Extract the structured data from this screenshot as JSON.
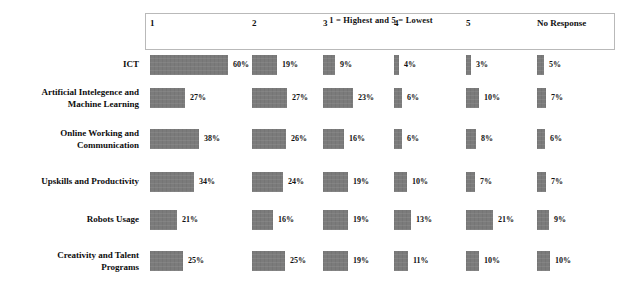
{
  "chart_data": {
    "type": "bar",
    "orientation": "horizontal-grouped",
    "title": "1 = Highest and 5 = Lowest",
    "xlabel": "",
    "ylabel": "",
    "grid": false,
    "legend": "none",
    "value_suffix": "%",
    "xlim": [
      0,
      60
    ],
    "categories": [
      "ICT",
      "Artificial Intelegence and Machine Learning",
      "Online Working and Communication",
      "Upskills and Productivity",
      "Robots Usage",
      "Creativity and Talent Programs"
    ],
    "column_headers": [
      "1",
      "2",
      "3",
      "4",
      "5",
      "No Response"
    ],
    "series": [
      {
        "name": "1",
        "values": [
          60,
          27,
          38,
          34,
          21,
          25
        ]
      },
      {
        "name": "2",
        "values": [
          19,
          27,
          26,
          24,
          16,
          25
        ]
      },
      {
        "name": "3",
        "values": [
          9,
          23,
          16,
          19,
          19,
          19
        ]
      },
      {
        "name": "4",
        "values": [
          4,
          6,
          6,
          10,
          13,
          11
        ]
      },
      {
        "name": "5",
        "values": [
          3,
          10,
          8,
          7,
          21,
          10
        ]
      },
      {
        "name": "No Response",
        "values": [
          5,
          7,
          6,
          7,
          9,
          10
        ]
      }
    ],
    "rows": [
      {
        "label": "ICT",
        "label_lines": [
          "ICT"
        ],
        "cells": [
          {
            "value": "60%",
            "pct": 60
          },
          {
            "value": "19%",
            "pct": 19
          },
          {
            "value": "9%",
            "pct": 9
          },
          {
            "value": "4%",
            "pct": 4
          },
          {
            "value": "3%",
            "pct": 3
          },
          {
            "value": "5%",
            "pct": 5
          }
        ]
      },
      {
        "label": "Artificial Intelegence and Machine Learning",
        "label_lines": [
          "Artificial Intelegence and",
          "Machine Learning"
        ],
        "cells": [
          {
            "value": "27%",
            "pct": 27
          },
          {
            "value": "27%",
            "pct": 27
          },
          {
            "value": "23%",
            "pct": 23
          },
          {
            "value": "6%",
            "pct": 6
          },
          {
            "value": "10%",
            "pct": 10
          },
          {
            "value": "7%",
            "pct": 7
          }
        ]
      },
      {
        "label": "Online Working and Communication",
        "label_lines": [
          "Online Working and",
          "Communication"
        ],
        "cells": [
          {
            "value": "38%",
            "pct": 38
          },
          {
            "value": "26%",
            "pct": 26
          },
          {
            "value": "16%",
            "pct": 16
          },
          {
            "value": "6%",
            "pct": 6
          },
          {
            "value": "8%",
            "pct": 8
          },
          {
            "value": "6%",
            "pct": 6
          }
        ]
      },
      {
        "label": "Upskills and Productivity",
        "label_lines": [
          "Upskills and Productivity"
        ],
        "cells": [
          {
            "value": "34%",
            "pct": 34
          },
          {
            "value": "24%",
            "pct": 24
          },
          {
            "value": "19%",
            "pct": 19
          },
          {
            "value": "10%",
            "pct": 10
          },
          {
            "value": "7%",
            "pct": 7
          },
          {
            "value": "7%",
            "pct": 7
          }
        ]
      },
      {
        "label": "Robots Usage",
        "label_lines": [
          "Robots Usage"
        ],
        "cells": [
          {
            "value": "21%",
            "pct": 21
          },
          {
            "value": "16%",
            "pct": 16
          },
          {
            "value": "19%",
            "pct": 19
          },
          {
            "value": "13%",
            "pct": 13
          },
          {
            "value": "21%",
            "pct": 21
          },
          {
            "value": "9%",
            "pct": 9
          }
        ]
      },
      {
        "label": "Creativity and Talent Programs",
        "label_lines": [
          "Creativity and Talent",
          "Programs"
        ],
        "cells": [
          {
            "value": "25%",
            "pct": 25
          },
          {
            "value": "25%",
            "pct": 25
          },
          {
            "value": "19%",
            "pct": 19
          },
          {
            "value": "11%",
            "pct": 11
          },
          {
            "value": "10%",
            "pct": 10
          },
          {
            "value": "10%",
            "pct": 10
          }
        ]
      }
    ]
  },
  "style": {
    "bar_color": "#7b7b7b",
    "text_color": "#111111",
    "border_color": "#b9b9b9",
    "background": "#ffffff"
  },
  "layout": {
    "column_x": [
      150,
      252,
      323,
      394,
      466,
      537
    ],
    "row_y": [
      55,
      88,
      129,
      172,
      210,
      251
    ],
    "max_bar_width": 78,
    "min_bar_width": 5,
    "bar_height": 20
  }
}
